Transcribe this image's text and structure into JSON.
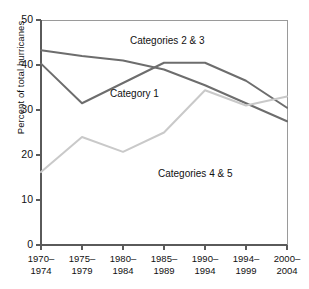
{
  "chart_data": {
    "type": "line",
    "title": "",
    "xlabel": "",
    "ylabel": "Percent of total hurricanes",
    "ylim": [
      0,
      50
    ],
    "yticks": [
      0,
      10,
      20,
      30,
      40,
      50
    ],
    "grid": false,
    "legend_position": "inline-annotations",
    "categories": [
      "1970-1974",
      "1975-1979",
      "1980-1984",
      "1985-1989",
      "1990-1994",
      "1994-1999",
      "2000-2004"
    ],
    "category_lines": [
      {
        "top": "1970–",
        "bottom": "1974"
      },
      {
        "top": "1975–",
        "bottom": "1979"
      },
      {
        "top": "1980–",
        "bottom": "1984"
      },
      {
        "top": "1985–",
        "bottom": "1989"
      },
      {
        "top": "1990–",
        "bottom": "1994"
      },
      {
        "top": "1994–",
        "bottom": "1999"
      },
      {
        "top": "2000–",
        "bottom": "2004"
      }
    ],
    "series": [
      {
        "name": "Categories 2 & 3",
        "color": "#6d6d6d",
        "values": [
          43.3,
          42.0,
          41.0,
          39.0,
          35.5,
          31.5,
          27.5
        ]
      },
      {
        "name": "Category 1",
        "color": "#6d6d6d",
        "values": [
          40.3,
          31.5,
          36.0,
          40.5,
          40.5,
          36.5,
          30.5
        ]
      },
      {
        "name": "Categories 4 & 5",
        "color": "#c9c9c9",
        "values": [
          16.2,
          24.0,
          20.7,
          25.0,
          34.4,
          31.0,
          33.0
        ]
      }
    ],
    "annotations": [
      {
        "text": "Categories 2 & 3",
        "x": 130,
        "y": 35
      },
      {
        "text": "Category 1",
        "x": 110,
        "y": 88
      },
      {
        "text": "Categories 4 & 5",
        "x": 158,
        "y": 168
      }
    ],
    "axis_color": "#5a5a5a"
  }
}
